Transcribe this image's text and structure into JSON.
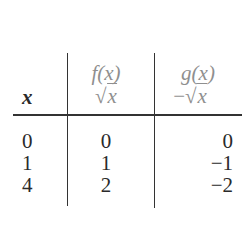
{
  "table": {
    "headers": [
      {
        "name": "x",
        "line1": "",
        "line2": "x"
      },
      {
        "name": "f(x)",
        "line1": "f(x)",
        "line2_prefix": "√",
        "line2_var": "x"
      },
      {
        "name": "g(x)",
        "line1": "g(x)",
        "line2_prefix": "−√",
        "line2_var": "x"
      }
    ],
    "rows": [
      {
        "x": "0",
        "f": "0",
        "g": "0"
      },
      {
        "x": "1",
        "f": "1",
        "g": "−1"
      },
      {
        "x": "4",
        "f": "2",
        "g": "−2"
      }
    ]
  },
  "colors": {
    "rule": "#333333",
    "header_text": "#8f8f8f",
    "body_text": "#2a2a2a"
  }
}
